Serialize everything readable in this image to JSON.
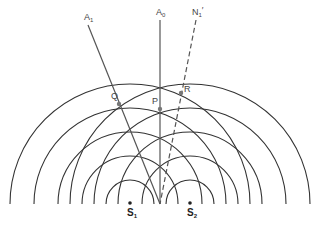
{
  "diagram": {
    "sources": [
      {
        "id": "S1",
        "label": "S",
        "sub": "1",
        "x": 130,
        "y": 203
      },
      {
        "id": "S2",
        "label": "S",
        "sub": "2",
        "x": 190,
        "y": 203
      }
    ],
    "wavefront_radii": [
      24,
      48,
      72,
      96,
      120
    ],
    "lines": [
      {
        "id": "A1",
        "label": "A",
        "sub": "1",
        "style": "solid",
        "from": [
          88,
          25
        ],
        "to": [
          160,
          204
        ]
      },
      {
        "id": "A0",
        "label": "A",
        "sub": "0",
        "style": "solid",
        "from": [
          160,
          20
        ],
        "to": [
          160,
          204
        ]
      },
      {
        "id": "N1p",
        "label": "N",
        "sub": "1",
        "prime": "′",
        "style": "dashed",
        "from": [
          196,
          20
        ],
        "to": [
          160,
          204
        ]
      }
    ],
    "points": [
      {
        "id": "Q",
        "label": "Q",
        "x": 119,
        "y": 104
      },
      {
        "id": "P",
        "label": "P",
        "x": 160,
        "y": 109
      },
      {
        "id": "R",
        "label": "R",
        "x": 181,
        "y": 93
      }
    ],
    "colors": {
      "wavefront": "#333333",
      "line": "#555555",
      "point": "#777777"
    }
  }
}
